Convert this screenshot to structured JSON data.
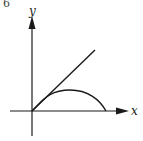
{
  "figure": {
    "panel_label": "6",
    "axes": {
      "x_label": "x",
      "y_label": "y"
    },
    "curves": [
      {
        "name": "straight-line",
        "description": "line from origin rising at ~45°"
      },
      {
        "name": "arc",
        "description": "arch from origin, tangent to line at origin, returning to x-axis"
      }
    ],
    "colors": {
      "stroke": "#1a1a1a",
      "background": "#ffffff"
    }
  }
}
